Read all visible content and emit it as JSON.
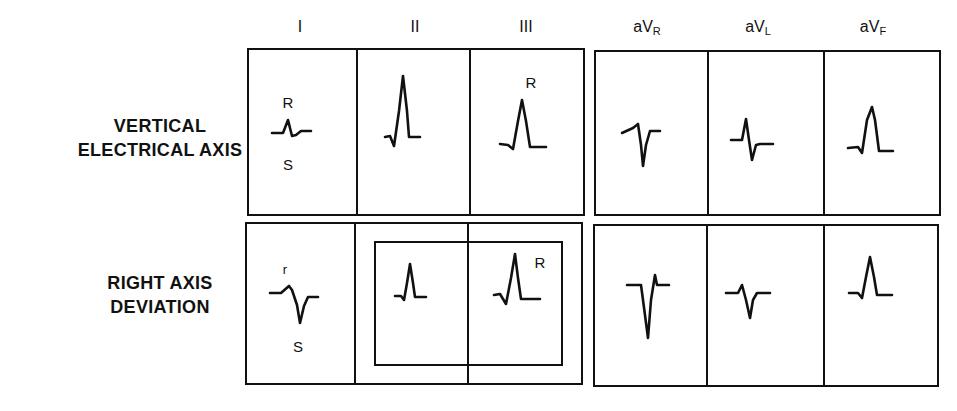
{
  "figure": {
    "leads": [
      {
        "id": "I",
        "label": "I",
        "sub": ""
      },
      {
        "id": "II",
        "label": "II",
        "sub": ""
      },
      {
        "id": "III",
        "label": "III",
        "sub": ""
      },
      {
        "id": "aVR",
        "label": "aV",
        "sub": "R"
      },
      {
        "id": "aVL",
        "label": "aV",
        "sub": "L"
      },
      {
        "id": "aVF",
        "label": "aV",
        "sub": "F"
      }
    ],
    "rows": [
      {
        "label_line1": "VERTICAL",
        "label_line2": "ELECTRICAL AXIS",
        "annotations": {
          "I_top": "R",
          "I_bottom": "S",
          "III_top": "R"
        }
      },
      {
        "label_line1": "RIGHT AXIS",
        "label_line2": "DEVIATION",
        "annotations": {
          "I_top": "r",
          "I_bottom": "S",
          "III_top": "R"
        },
        "highlight": "Leads II and III boxed together"
      }
    ],
    "colors": {
      "ink": "#111111",
      "background": "#ffffff"
    }
  }
}
